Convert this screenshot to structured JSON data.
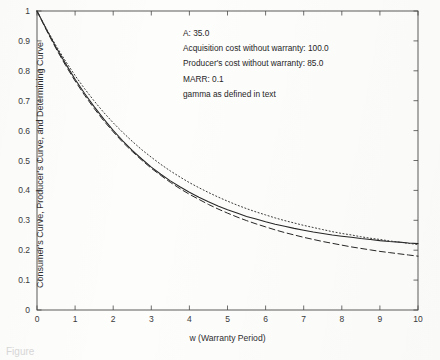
{
  "figure": {
    "caption_fragment": "Figure"
  },
  "chart_data": {
    "type": "line",
    "title": "",
    "xlabel": "w (Warranty Period)",
    "ylabel": "Consumer's Curve, Producer's Curve, and Determining Curve",
    "xlim": [
      0,
      10
    ],
    "ylim": [
      0,
      1
    ],
    "grid": false,
    "legend_position": "none",
    "xticks": [
      "0",
      "1",
      "2",
      "3",
      "4",
      "5",
      "6",
      "7",
      "8",
      "9",
      "10"
    ],
    "yticks": [
      "0",
      "0.1",
      "0.2",
      "0.3",
      "0.4",
      "0.5",
      "0.6",
      "0.7",
      "0.8",
      "0.9",
      "1"
    ],
    "x": [
      0,
      0.25,
      0.5,
      0.75,
      1,
      1.25,
      1.5,
      1.75,
      2,
      2.25,
      2.5,
      2.75,
      3,
      3.25,
      3.5,
      3.75,
      4,
      4.25,
      4.5,
      4.75,
      5,
      5.25,
      5.5,
      5.75,
      6,
      6.25,
      6.5,
      6.75,
      7,
      7.25,
      7.5,
      7.75,
      8,
      8.25,
      8.5,
      8.75,
      9,
      9.25,
      9.5,
      9.75,
      10
    ],
    "series": [
      {
        "name": "Consumer's Curve",
        "style": "solid",
        "color": "#262626",
        "values": [
          1.0,
          0.938,
          0.879,
          0.824,
          0.772,
          0.724,
          0.68,
          0.639,
          0.601,
          0.566,
          0.534,
          0.505,
          0.478,
          0.454,
          0.432,
          0.412,
          0.394,
          0.377,
          0.362,
          0.348,
          0.335,
          0.324,
          0.313,
          0.304,
          0.295,
          0.287,
          0.28,
          0.273,
          0.267,
          0.261,
          0.256,
          0.251,
          0.247,
          0.243,
          0.239,
          0.236,
          0.232,
          0.229,
          0.227,
          0.224,
          0.222
        ]
      },
      {
        "name": "Producer's Curve",
        "style": "dashed",
        "color": "#262626",
        "values": [
          1.0,
          0.935,
          0.874,
          0.818,
          0.766,
          0.718,
          0.674,
          0.633,
          0.596,
          0.561,
          0.53,
          0.501,
          0.474,
          0.45,
          0.427,
          0.406,
          0.387,
          0.37,
          0.353,
          0.338,
          0.324,
          0.311,
          0.299,
          0.288,
          0.278,
          0.268,
          0.259,
          0.251,
          0.243,
          0.236,
          0.229,
          0.223,
          0.217,
          0.211,
          0.206,
          0.201,
          0.196,
          0.192,
          0.188,
          0.184,
          0.18
        ]
      },
      {
        "name": "Determining Curve",
        "style": "dotted",
        "color": "#3a3a3a",
        "values": [
          1.0,
          0.94,
          0.884,
          0.832,
          0.784,
          0.74,
          0.699,
          0.661,
          0.626,
          0.594,
          0.564,
          0.536,
          0.511,
          0.487,
          0.465,
          0.445,
          0.426,
          0.409,
          0.393,
          0.378,
          0.364,
          0.351,
          0.339,
          0.328,
          0.318,
          0.308,
          0.299,
          0.291,
          0.283,
          0.276,
          0.269,
          0.262,
          0.256,
          0.251,
          0.245,
          0.24,
          0.236,
          0.231,
          0.227,
          0.223,
          0.219
        ]
      }
    ],
    "annotations": [
      "A:  35.0",
      "Acquisition cost without warranty: 100.0",
      "Producer's cost without warranty:  85.0",
      "MARR:   0.1",
      "gamma as defined in text"
    ]
  }
}
